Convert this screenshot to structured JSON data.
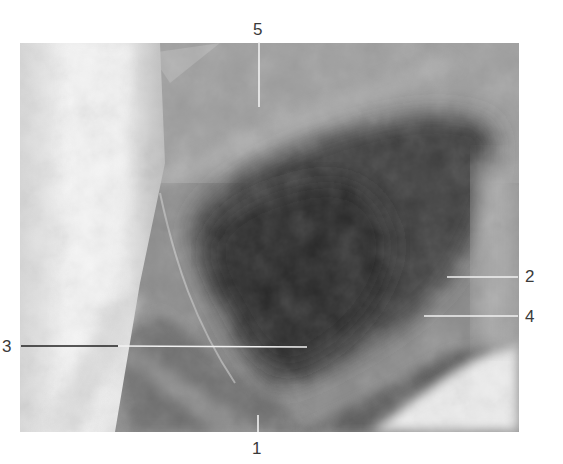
{
  "figure": {
    "labels": [
      {
        "id": "label-1",
        "text": "1"
      },
      {
        "id": "label-2",
        "text": "2"
      },
      {
        "id": "label-3",
        "text": "3"
      },
      {
        "id": "label-4",
        "text": "4"
      },
      {
        "id": "label-5",
        "text": "5"
      }
    ],
    "colors": {
      "background": "#ffffff",
      "leader_line_light": "#f2f2f2",
      "leader_line_dark": "#222222",
      "label_text": "#3a3a3a"
    }
  }
}
